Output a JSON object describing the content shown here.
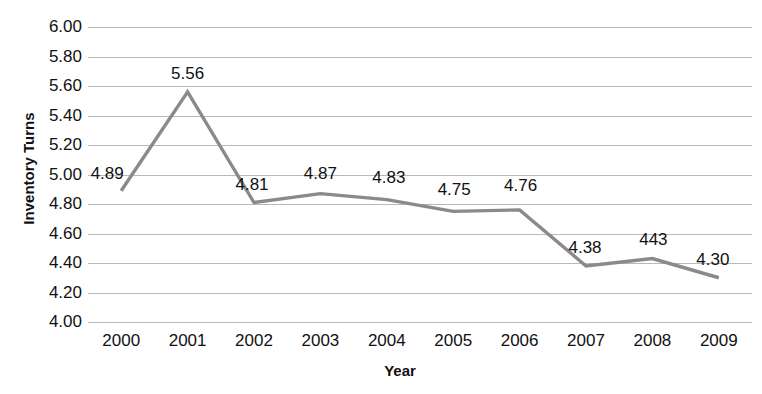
{
  "chart_data": {
    "type": "line",
    "title": "",
    "xlabel": "Year",
    "ylabel": "Inventory Turns",
    "categories": [
      "2000",
      "2001",
      "2002",
      "2003",
      "2004",
      "2005",
      "2006",
      "2007",
      "2008",
      "2009"
    ],
    "values": [
      4.89,
      5.56,
      4.81,
      4.87,
      4.83,
      4.75,
      4.76,
      4.38,
      4.43,
      4.3
    ],
    "point_labels": [
      "4.89",
      "5.56",
      "4.81",
      "4.87",
      "4.83",
      "4.75",
      "4.76",
      "4.38",
      "443",
      "4.30"
    ],
    "series": [
      {
        "name": "Inventory Turns",
        "values": [
          4.89,
          5.56,
          4.81,
          4.87,
          4.83,
          4.75,
          4.76,
          4.38,
          4.43,
          4.3
        ],
        "color": "#8a8a8a"
      }
    ],
    "ylim": [
      4.0,
      6.0
    ],
    "ytick_step": 0.2,
    "ytick_labels": [
      "6.00",
      "5.80",
      "5.60",
      "5.40",
      "5.20",
      "5.00",
      "4.80",
      "4.60",
      "4.40",
      "4.20",
      "4.00"
    ],
    "ytick_values": [
      6.0,
      5.8,
      5.6,
      5.4,
      5.2,
      5.0,
      4.8,
      4.6,
      4.4,
      4.2,
      4.0
    ],
    "grid": true,
    "grid_color": "#b9b9b9",
    "legend": false,
    "legend_position": "none",
    "line_color": "#8a8a8a",
    "label_color": "#111111",
    "background": "#ffffff"
  }
}
